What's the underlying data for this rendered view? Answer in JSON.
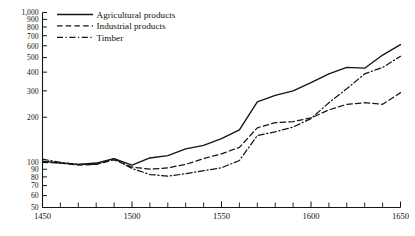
{
  "chart_data": {
    "type": "line",
    "title": "",
    "subtitle": "",
    "xlabel": "",
    "ylabel": "",
    "yscale": "log",
    "ylim": [
      50,
      1000
    ],
    "xlim": [
      1450,
      1650
    ],
    "grid": false,
    "legend_position": "top-left",
    "y_ticks": [
      50,
      60,
      70,
      80,
      90,
      100,
      200,
      300,
      400,
      500,
      600,
      700,
      800,
      900,
      1000
    ],
    "y_tick_labels": [
      "50",
      "60",
      "70",
      "80",
      "90",
      "100",
      "200",
      "300",
      "400",
      "500",
      "600",
      "700",
      "800",
      "900",
      "1,000"
    ],
    "x_ticks": [
      1450,
      1500,
      1550,
      1600,
      1650
    ],
    "x_tick_labels": [
      "1450",
      "1500",
      "1550",
      "1600",
      "1650"
    ],
    "x_minor_tick_step": 10,
    "x": [
      1450,
      1460,
      1470,
      1480,
      1490,
      1500,
      1510,
      1520,
      1530,
      1540,
      1550,
      1560,
      1570,
      1580,
      1590,
      1600,
      1610,
      1620,
      1630,
      1640,
      1650
    ],
    "series": [
      {
        "name": "Agricultural products",
        "style": "solid",
        "values": [
          102,
          99,
          97,
          99,
          106,
          96,
          107,
          111,
          123,
          130,
          144,
          165,
          253,
          280,
          300,
          340,
          390,
          430,
          425,
          520,
          610
        ]
      },
      {
        "name": "Industrial products",
        "style": "dashed",
        "values": [
          100,
          99,
          96,
          97,
          104,
          93,
          90,
          92,
          97,
          106,
          114,
          126,
          170,
          184,
          187,
          198,
          224,
          244,
          250,
          244,
          292
        ]
      },
      {
        "name": "Timber",
        "style": "dashdot",
        "values": [
          105,
          100,
          97,
          97,
          106,
          91,
          83,
          81,
          84,
          88,
          92,
          103,
          151,
          160,
          172,
          196,
          250,
          310,
          390,
          430,
          510
        ]
      }
    ]
  },
  "legend": {
    "items": [
      {
        "label": "Agricultural products",
        "style": "solid"
      },
      {
        "label": "Industrial products",
        "style": "dashed"
      },
      {
        "label": "Timber",
        "style": "dashdot"
      }
    ]
  }
}
